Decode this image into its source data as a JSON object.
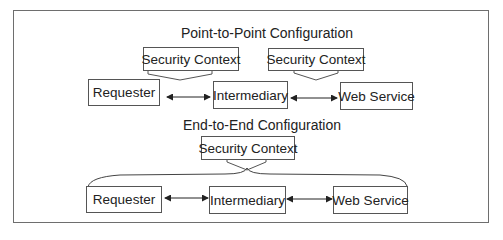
{
  "diagram": {
    "point_to_point": {
      "title": "Point-to-Point Configuration",
      "security_contexts": [
        "Security Context",
        "Security Context"
      ],
      "nodes": [
        "Requester",
        "Intermediary",
        "Web Service"
      ]
    },
    "end_to_end": {
      "title": "End-to-End Configuration",
      "security_context": "Security Context",
      "nodes": [
        "Requester",
        "Intermediary",
        "Web Service"
      ]
    },
    "colors": {
      "line": "#555555",
      "frame": "#6e6e6e",
      "text": "#222222"
    }
  }
}
